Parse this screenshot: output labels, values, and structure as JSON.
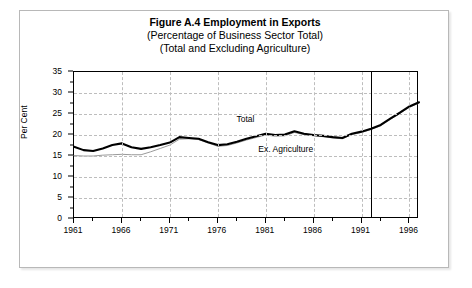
{
  "figure": {
    "title_line1": "Figure A.4  Employment in Exports",
    "title_line2": "(Percentage of Business Sector Total)",
    "title_line3": "(Total and Excluding Agriculture)"
  },
  "chart_data": {
    "type": "line",
    "title": "Figure A.4  Employment in Exports",
    "subtitle": "(Percentage of Business Sector Total) (Total and Excluding Agriculture)",
    "xlabel": "",
    "ylabel": "Per Cent",
    "ylim": [
      0,
      35
    ],
    "xlim": [
      1961,
      1997
    ],
    "ytick_values": [
      0,
      5,
      10,
      15,
      20,
      25,
      30,
      35
    ],
    "ytick_labels": [
      "0",
      "5",
      "10",
      "15",
      "20",
      "25",
      "30",
      "35"
    ],
    "ytick_minor_values": [
      2.5,
      7.5,
      12.5,
      17.5,
      22.5,
      27.5,
      32.5
    ],
    "xtick_values": [
      1961,
      1966,
      1971,
      1976,
      1981,
      1986,
      1991,
      1996
    ],
    "xtick_labels": [
      "1961",
      "1966",
      "1971",
      "1976",
      "1981",
      "1986",
      "1991",
      "1996"
    ],
    "xtick_minor_values": [
      1963,
      1968,
      1973,
      1978,
      1983,
      1988,
      1993
    ],
    "grid": true,
    "grid_style": "dashed",
    "grid_color": "#bdbdbd",
    "legend_position": "inline-annotation",
    "annotations": [
      {
        "text": "Total",
        "x": 1979.0,
        "y": 23.6
      },
      {
        "text": "Ex. Agriculture",
        "x": 1983.2,
        "y": 16.4
      }
    ],
    "vertical_reference_line": {
      "x": 1992.0,
      "color": "#000000"
    },
    "x": [
      1961,
      1962,
      1963,
      1964,
      1965,
      1966,
      1967,
      1968,
      1969,
      1970,
      1971,
      1972,
      1973,
      1974,
      1975,
      1976,
      1977,
      1978,
      1979,
      1980,
      1981,
      1982,
      1983,
      1984,
      1985,
      1986,
      1987,
      1988,
      1989,
      1990,
      1991,
      1992,
      1993,
      1994,
      1995,
      1996,
      1997
    ],
    "series": [
      {
        "name": "Total",
        "color": "#000000",
        "values": [
          17.2,
          16.4,
          16.2,
          16.8,
          17.6,
          18.0,
          17.1,
          16.7,
          17.1,
          17.6,
          18.2,
          19.5,
          19.3,
          19.1,
          18.3,
          17.6,
          17.8,
          18.4,
          19.1,
          19.7,
          20.3,
          20.0,
          20.1,
          20.9,
          20.3,
          20.0,
          19.8,
          19.5,
          19.3,
          20.3,
          20.8,
          21.5,
          22.4,
          23.9,
          25.3,
          26.8,
          27.8
        ]
      },
      {
        "name": "Ex. Agriculture",
        "color": "#9a9a9a",
        "values": [
          15.1,
          15.0,
          15.0,
          15.2,
          15.3,
          15.4,
          15.3,
          15.3,
          16.0,
          16.8,
          17.6,
          19.0,
          19.1,
          18.9,
          18.1,
          17.3,
          17.5,
          18.1,
          18.8,
          19.4,
          20.0,
          19.7,
          19.8,
          20.6,
          20.1,
          19.8,
          19.6,
          19.3,
          19.1,
          20.1,
          20.6,
          21.3,
          22.2,
          23.7,
          25.1,
          26.6,
          27.6
        ]
      }
    ]
  }
}
